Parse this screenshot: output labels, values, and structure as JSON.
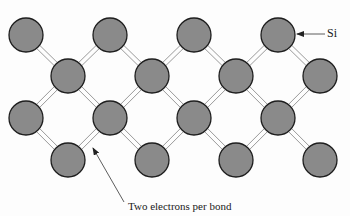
{
  "diagram": {
    "atom_label": "Si",
    "bond_label": "Two electrons per bond",
    "colors": {
      "atom_fill": "#8a8a8a",
      "atom_stroke": "#1e1e1e",
      "bond_stroke": "#9a9a9a",
      "text": "#1a1a1a",
      "arrow": "#333333"
    },
    "atom_radius": 17,
    "atoms": [
      {
        "row": 1,
        "x": 26,
        "y": 35
      },
      {
        "row": 1,
        "x": 110,
        "y": 35
      },
      {
        "row": 1,
        "x": 194,
        "y": 35
      },
      {
        "row": 1,
        "x": 278,
        "y": 35
      },
      {
        "row": 2,
        "x": 68,
        "y": 76
      },
      {
        "row": 2,
        "x": 152,
        "y": 76
      },
      {
        "row": 2,
        "x": 236,
        "y": 76
      },
      {
        "row": 2,
        "x": 320,
        "y": 76
      },
      {
        "row": 3,
        "x": 26,
        "y": 118
      },
      {
        "row": 3,
        "x": 110,
        "y": 118
      },
      {
        "row": 3,
        "x": 194,
        "y": 118
      },
      {
        "row": 3,
        "x": 278,
        "y": 118
      },
      {
        "row": 4,
        "x": 68,
        "y": 160
      },
      {
        "row": 4,
        "x": 152,
        "y": 160
      },
      {
        "row": 4,
        "x": 236,
        "y": 160
      },
      {
        "row": 4,
        "x": 320,
        "y": 160
      }
    ],
    "annotations": [
      {
        "text_key": "atom_label",
        "arrow_from": [
          325,
          34
        ],
        "arrow_to": [
          297,
          34
        ]
      },
      {
        "text_key": "bond_label",
        "arrow_from": [
          124,
          202
        ],
        "arrow_to": [
          93,
          148
        ]
      }
    ]
  }
}
